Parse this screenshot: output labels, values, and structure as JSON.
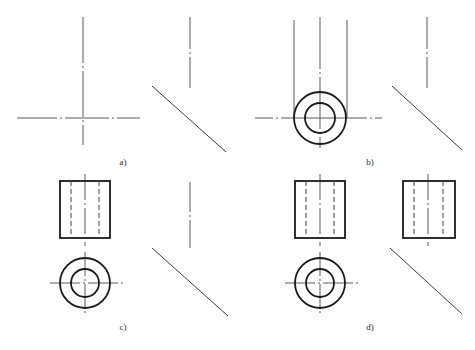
{
  "document": {
    "title": "Orthographic Projection Construction Steps",
    "background_color": "#ffffff",
    "line_color": "#1a1a1a",
    "centerline_color": "#5a5a5a",
    "hidden_line_color": "#3a3a3a",
    "width": 475,
    "height": 350
  },
  "panels": [
    {
      "id": "a",
      "label": "a)",
      "label_x": 123,
      "label_y": 165,
      "description": "Step a: centre lines laid out for front view and 45 degree mitre line",
      "elements": {
        "vertical_centerline": {
          "x": 83,
          "y1": 17,
          "y2": 147
        },
        "horizontal_centerline": {
          "y": 118,
          "x1": 17,
          "x2": 140
        },
        "side_vertical_centerline": {
          "x": 190,
          "y1": 17,
          "y2": 88
        },
        "mitre_line": {
          "x1": 152,
          "y1": 86,
          "x2": 226,
          "y2": 152
        }
      }
    },
    {
      "id": "b",
      "label": "b)",
      "label_x": 370,
      "label_y": 165,
      "description": "Step b: top view circles drawn with projector lines rising to front view",
      "elements": {
        "circle_center": {
          "cx": 320,
          "cy": 118
        },
        "outer_radius": 26,
        "inner_radius": 15,
        "projector_left": {
          "x": 294,
          "y1": 20,
          "y2": 118
        },
        "projector_center": {
          "x": 320,
          "y1": 17,
          "y2": 148
        },
        "projector_right": {
          "x": 347,
          "y1": 20,
          "y2": 118
        },
        "horizontal_centerline": {
          "y": 118,
          "x1": 255,
          "x2": 382
        },
        "side_vertical_centerline": {
          "x": 427,
          "y1": 17,
          "y2": 88
        },
        "mitre_line": {
          "x1": 392,
          "y1": 86,
          "x2": 462,
          "y2": 150
        }
      }
    },
    {
      "id": "c",
      "label": "c)",
      "label_x": 123,
      "label_y": 330,
      "description": "Step c: front view rectangle completed above top view circles with hidden lines",
      "elements": {
        "rect": {
          "x": 60,
          "y": 181,
          "width": 50,
          "height": 57
        },
        "hidden_line_left": {
          "x": 71,
          "y1": 181,
          "y2": 238
        },
        "hidden_line_right": {
          "x": 99,
          "y1": 181,
          "y2": 238
        },
        "rect_centerline": {
          "x": 85,
          "y1": 174,
          "y2": 246
        },
        "circle_center": {
          "cx": 85,
          "cy": 283
        },
        "outer_radius": 25,
        "inner_radius": 14,
        "circle_vertical_centerline": {
          "x": 85,
          "y1": 252,
          "y2": 315
        },
        "circle_horizontal_centerline": {
          "y": 283,
          "x1": 50,
          "x2": 130
        },
        "side_vertical_centerline": {
          "x": 190,
          "y1": 182,
          "y2": 248
        },
        "mitre_line": {
          "x1": 152,
          "y1": 248,
          "x2": 228,
          "y2": 316
        }
      }
    },
    {
      "id": "d",
      "label": "d)",
      "label_x": 370,
      "label_y": 330,
      "description": "Step d: side view rectangle projected across via the mitre line, all three views complete",
      "elements": {
        "front_rect": {
          "x": 295,
          "y": 181,
          "width": 50,
          "height": 57
        },
        "front_hidden_left": {
          "x": 306,
          "y1": 181,
          "y2": 238
        },
        "front_hidden_right": {
          "x": 334,
          "y1": 181,
          "y2": 238
        },
        "front_centerline": {
          "x": 320,
          "y1": 174,
          "y2": 246
        },
        "circle_center": {
          "cx": 320,
          "cy": 283
        },
        "outer_radius": 25,
        "inner_radius": 14,
        "circle_vertical_centerline": {
          "x": 320,
          "y1": 252,
          "y2": 315
        },
        "circle_horizontal_centerline": {
          "y": 283,
          "x1": 285,
          "x2": 365
        },
        "side_rect": {
          "x": 403,
          "y": 181,
          "width": 52,
          "height": 57
        },
        "side_hidden_left": {
          "x": 414,
          "y1": 181,
          "y2": 238
        },
        "side_hidden_right": {
          "x": 443,
          "y1": 181,
          "y2": 238
        },
        "side_centerline": {
          "x": 428,
          "y1": 174,
          "y2": 246
        },
        "mitre_line": {
          "x1": 390,
          "y1": 248,
          "x2": 462,
          "y2": 314
        }
      }
    }
  ]
}
